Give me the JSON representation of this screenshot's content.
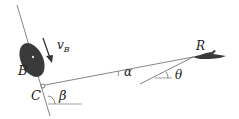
{
  "diagram": {
    "type": "kinematics-figure",
    "labels": {
      "vB": "v",
      "vB_sub": "B",
      "B": "B",
      "C": "C",
      "R": "R",
      "alpha": "α",
      "beta": "β",
      "theta": "θ"
    },
    "colors": {
      "line": "#555555",
      "body": "#3a3a3a",
      "text": "#222222"
    }
  }
}
